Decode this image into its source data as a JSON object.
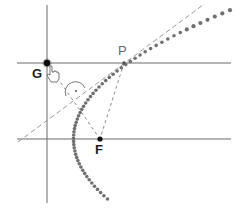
{
  "diagram": {
    "points": {
      "G": {
        "label": "G",
        "x": 47,
        "y": 63
      },
      "P": {
        "label": "P",
        "x": 124,
        "y": 63
      },
      "F": {
        "label": "F",
        "x": 100,
        "y": 139
      }
    },
    "lines": {
      "directrix": {
        "x": 47,
        "y1": 5,
        "y2": 203
      },
      "horizontal_through_G_P": {
        "y": 63,
        "x1": 17,
        "x2": 231
      },
      "horizontal_through_F": {
        "y": 139,
        "x1": 17,
        "x2": 231
      },
      "tangent": {
        "x1": 18,
        "y1": 142,
        "x2": 203,
        "y2": 5
      },
      "segment_GF": {
        "from": "G",
        "to": "F"
      },
      "segment_PF": {
        "from": "P",
        "to": "F"
      }
    },
    "parabola": {
      "vertex_x": 73.5,
      "vertex_y": 139,
      "p4": 106,
      "y_min": 7,
      "y_max": 200
    },
    "right_angle_marker": {
      "x": 74,
      "y": 92,
      "symbol": "·"
    },
    "colors": {
      "line": "#6b6b6b",
      "dashed": "#8a8a8a",
      "curve": "#707070",
      "point": "#111111",
      "label": "#333333",
      "label_P": "#666666"
    },
    "cursor": {
      "type": "hand-pointer",
      "x": 52,
      "y": 72
    }
  }
}
